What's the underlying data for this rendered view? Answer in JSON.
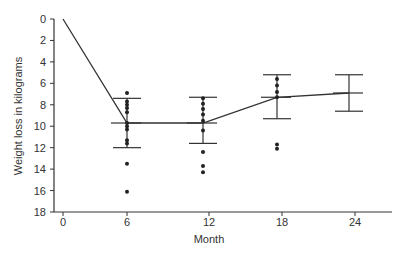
{
  "chart_data": {
    "type": "scatter",
    "title": "",
    "xlabel": "Month",
    "ylabel": "Weight loss in kilograms",
    "x_ticks": [
      0,
      6,
      12,
      18,
      24
    ],
    "y_ticks": [
      0,
      2,
      4,
      6,
      8,
      10,
      12,
      14,
      16,
      18
    ],
    "ylim": [
      0,
      18
    ],
    "y_inverted": true,
    "grid": false,
    "legend": "none",
    "mean_line": {
      "x": [
        0,
        6,
        12,
        18,
        24
      ],
      "y": [
        0,
        9.7,
        9.7,
        7.3,
        6.9
      ]
    },
    "error_bars": [
      {
        "x": 6,
        "mean": 9.7,
        "upper": 7.4,
        "lower": 12.0
      },
      {
        "x": 12,
        "mean": 9.7,
        "upper": 7.3,
        "lower": 11.6
      },
      {
        "x": 18,
        "mean": 7.3,
        "upper": 5.2,
        "lower": 9.3
      },
      {
        "x": 24,
        "mean": 6.9,
        "upper": 5.2,
        "lower": 8.6
      }
    ],
    "individual_points": [
      {
        "x": 6,
        "values": [
          6.9,
          7.7,
          8.0,
          8.3,
          8.7,
          9.7,
          10.0,
          10.3,
          11.3,
          11.6,
          13.5,
          16.1
        ]
      },
      {
        "x": 12,
        "values": [
          7.4,
          7.9,
          8.4,
          8.9,
          9.5,
          10.4,
          12.4,
          13.7,
          14.3
        ]
      },
      {
        "x": 18,
        "values": [
          5.6,
          6.2,
          6.8,
          7.3,
          11.7,
          12.1
        ]
      }
    ]
  }
}
